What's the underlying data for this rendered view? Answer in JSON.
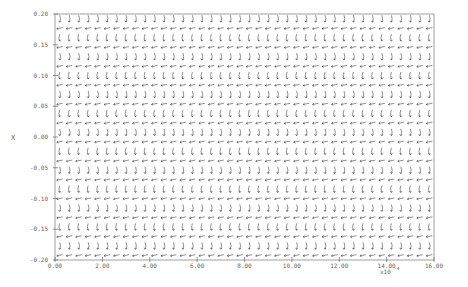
{
  "chart_data": {
    "type": "quiver",
    "title": "",
    "xlabel": "",
    "ylabel": "X",
    "x_multiplier_label": "x10",
    "x_multiplier_exponent": "-4",
    "xlim": [
      0,
      16
    ],
    "ylim": [
      -0.2,
      0.2
    ],
    "x_ticks": [
      0,
      2,
      4,
      6,
      8,
      10,
      12,
      14,
      16
    ],
    "x_tick_labels": [
      "0.00",
      "2.00",
      "4.00",
      "6.00",
      "8.00",
      "10.00",
      "12.00",
      "14.00",
      "16.00"
    ],
    "y_ticks": [
      0.2,
      0.15,
      0.1,
      0.05,
      0.0,
      -0.05,
      -0.1,
      -0.15,
      -0.2
    ],
    "y_tick_labels": [
      "0.20",
      "0.15",
      "0.10",
      "0.05",
      "0.00",
      "-0.05",
      "-0.10",
      "-0.15",
      "-0.20"
    ],
    "grid": false,
    "legend": null,
    "field": {
      "columns": 40,
      "rows": 26,
      "description": "Small direction-field arrows on a regular grid; rows alternate between near-horizontal arrows pointing left and near-vertical arrows curving downward/upward, pattern repeating across the time axis"
    }
  },
  "colors": {
    "frame": "#888888",
    "arrows": "#444444",
    "text": "#666666",
    "background": "#ffffff"
  }
}
